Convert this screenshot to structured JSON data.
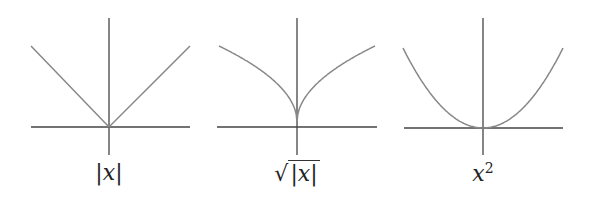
{
  "panels": [
    {
      "name": "abs",
      "label": "|x|",
      "label_parts": {
        "pre": "|",
        "var": "x",
        "post": "|"
      },
      "function": "absolute value"
    },
    {
      "name": "sqrt-abs",
      "label": "√|x|",
      "label_parts": {
        "radical": "√",
        "pre": "|",
        "var": "x",
        "post": "|"
      },
      "function": "square root of absolute value"
    },
    {
      "name": "square",
      "label": "x²",
      "label_parts": {
        "var": "x",
        "sup": "2"
      },
      "function": "x squared"
    }
  ],
  "colors": {
    "axes": "#444444",
    "curve": "#888888"
  }
}
